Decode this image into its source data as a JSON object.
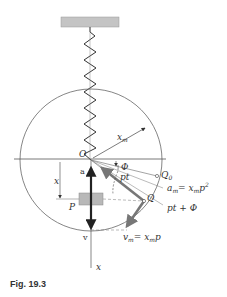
{
  "figure": {
    "caption": "Fig. 19.3",
    "labels": {
      "origin": "O",
      "block": "P",
      "radius": "x",
      "radius_sub": "m",
      "phase": "Φ",
      "angle_pt": "pt",
      "point_q0": "Q",
      "point_q0_sub": "0",
      "point_q": "Q",
      "accel_max": "a",
      "accel_max_eq": "= x",
      "accel_max_tail": "p",
      "angle_total": "pt + Φ",
      "vel_max": "v",
      "vel_max_eq": "= x",
      "vel_max_tail": "p",
      "disp": "x",
      "accel": "a",
      "vel": "v",
      "axis_x": "x",
      "sub_m": "m",
      "sup_2": "2"
    },
    "colors": {
      "line": "#555555",
      "spring": "#333333",
      "block": "#b8b8b8",
      "ceiling": "#c4c4c4",
      "arrow_dark": "#222222",
      "arrow_grey": "#777777"
    }
  }
}
